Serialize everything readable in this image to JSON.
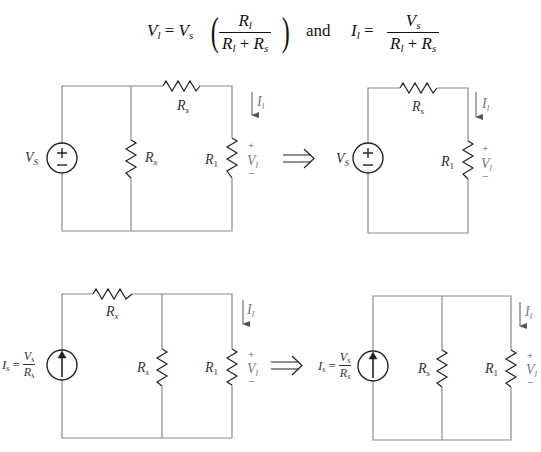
{
  "equation": {
    "lhs1_var": "V",
    "lhs1_sub": "l",
    "eq": "=",
    "rhs1_var": "V",
    "rhs1_sub": "s",
    "frac1_num_var": "R",
    "frac1_num_sub": "l",
    "frac1_den": "R",
    "frac1_den_sub1": "l",
    "frac1_den_plus": " + ",
    "frac1_den_var2": "R",
    "frac1_den_sub2": "s",
    "paren_open": "(",
    "paren_close": ")",
    "connector": "and",
    "lhs2_var": "I",
    "lhs2_sub": "l",
    "frac2_num_var": "V",
    "frac2_num_sub": "s",
    "frac2_den_var1": "R",
    "frac2_den_sub1": "l",
    "frac2_den_plus": " + ",
    "frac2_den_var2": "R",
    "frac2_den_sub2": "s"
  },
  "transform_arrow": "⟹",
  "circuits": {
    "top_left": {
      "source_label": "V",
      "source_sub": "S",
      "source_type": "voltage",
      "series_resistor": {
        "var": "R",
        "sub": "s"
      },
      "shunt_resistor": {
        "var": "R",
        "sub": "x"
      },
      "load_resistor": {
        "var": "R",
        "sub": "1"
      },
      "current": {
        "var": "I",
        "sub": "l"
      },
      "voltage": {
        "var": "V",
        "sub": "l",
        "plus": "+",
        "minus": "−"
      }
    },
    "top_right": {
      "source_label": "V",
      "source_sub": "S",
      "source_type": "voltage",
      "series_resistor": {
        "var": "R",
        "sub": "s"
      },
      "load_resistor": {
        "var": "R",
        "sub": "1"
      },
      "current": {
        "var": "I",
        "sub": "l"
      },
      "voltage": {
        "var": "V",
        "sub": "l",
        "plus": "+",
        "minus": "−"
      }
    },
    "bottom_left": {
      "source_type": "current",
      "source_eq": {
        "var": "I",
        "sub": "s",
        "eq": "=",
        "num_var": "V",
        "num_sub": "s",
        "den_var": "R",
        "den_sub": "s"
      },
      "series_resistor": {
        "var": "R",
        "sub": "x"
      },
      "shunt_resistor": {
        "var": "R",
        "sub": "s"
      },
      "load_resistor": {
        "var": "R",
        "sub": "1"
      },
      "current": {
        "var": "I",
        "sub": "l"
      },
      "voltage": {
        "var": "V",
        "sub": "l",
        "plus": "+",
        "minus": "−"
      }
    },
    "bottom_right": {
      "source_type": "current",
      "source_eq": {
        "var": "I",
        "sub": "s",
        "eq": "=",
        "num_var": "V",
        "num_sub": "s",
        "den_var": "R",
        "den_sub": "s"
      },
      "shunt_resistor": {
        "var": "R",
        "sub": "s"
      },
      "load_resistor": {
        "var": "R",
        "sub": "1"
      },
      "current": {
        "var": "I",
        "sub": "l"
      },
      "voltage": {
        "var": "V",
        "sub": "l",
        "plus": "+",
        "minus": "−"
      }
    }
  },
  "colors": {
    "wire": "#8a8a8a",
    "component": "#222222",
    "label": "#333333"
  }
}
